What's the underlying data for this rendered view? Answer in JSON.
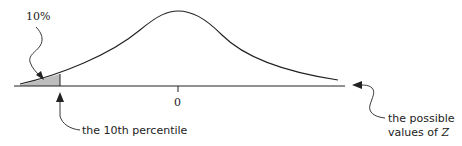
{
  "diagram": {
    "labels": {
      "percent": "10%",
      "zero_tick": "0",
      "percentile": "the 10th percentile",
      "possible_line1": "the possible",
      "possible_line2_prefix": "values of ",
      "variable": "Z"
    },
    "colors": {
      "stroke": "#222222",
      "shade": "#bdbdbd"
    }
  }
}
